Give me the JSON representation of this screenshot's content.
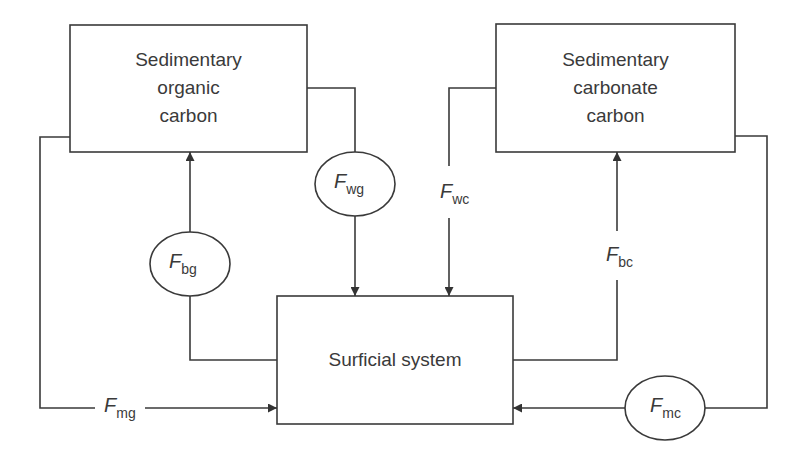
{
  "diagram": {
    "type": "carbon-cycle-flux-diagram",
    "boxes": [
      {
        "id": "organic",
        "lines": [
          "Sedimentary",
          "organic",
          "carbon"
        ]
      },
      {
        "id": "carbonate",
        "lines": [
          "Sedimentary",
          "carbonate",
          "carbon"
        ]
      },
      {
        "id": "surficial",
        "lines": [
          "Surficial system"
        ]
      }
    ],
    "fluxes": [
      {
        "id": "wg",
        "symbol": "F",
        "subscript": "wg",
        "from": "Sedimentary organic carbon",
        "to": "Surficial system",
        "circled": true
      },
      {
        "id": "bg",
        "symbol": "F",
        "subscript": "bg",
        "from": "Surficial system",
        "to": "Sedimentary organic carbon",
        "circled": true
      },
      {
        "id": "mg",
        "symbol": "F",
        "subscript": "mg",
        "from": "Sedimentary organic carbon",
        "to": "Surficial system",
        "circled": false
      },
      {
        "id": "wc",
        "symbol": "F",
        "subscript": "wc",
        "from": "Sedimentary carbonate carbon",
        "to": "Surficial system",
        "circled": false
      },
      {
        "id": "bc",
        "symbol": "F",
        "subscript": "bc",
        "from": "Surficial system",
        "to": "Sedimentary carbonate carbon",
        "circled": false
      },
      {
        "id": "mc",
        "symbol": "F",
        "subscript": "mc",
        "from": "Sedimentary carbonate carbon",
        "to": "Surficial system",
        "circled": true
      }
    ],
    "colors": {
      "line": "#3a3a3a",
      "background": "#ffffff"
    }
  }
}
